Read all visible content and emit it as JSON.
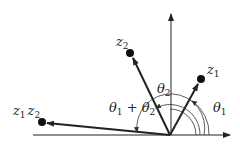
{
  "diagram": {
    "title": "",
    "colors": {
      "stroke": "#222222",
      "arc": "#333333",
      "background": "#ffffff"
    },
    "points": {
      "z1": {
        "label": "z",
        "sub": "1"
      },
      "z2": {
        "label": "z",
        "sub": "2"
      },
      "product": {
        "label1": "z",
        "sub1": "1",
        "label2": "z",
        "sub2": "2"
      }
    },
    "angles": {
      "theta1": {
        "label": "θ",
        "sub": "1"
      },
      "theta2": {
        "label": "θ",
        "sub": "2"
      },
      "sum": {
        "label1": "θ",
        "sub1": "1",
        "plus": " + ",
        "label2": "θ",
        "sub2": "2"
      }
    }
  }
}
